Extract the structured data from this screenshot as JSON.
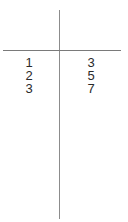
{
  "t_table": {
    "left_header": "",
    "right_header": "",
    "rows": [
      {
        "left": "1",
        "right": "3"
      },
      {
        "left": "2",
        "right": "5"
      },
      {
        "left": "3",
        "right": "7"
      }
    ]
  },
  "colors": {
    "line": "#8c8c8c",
    "text": "#2a2a2a",
    "background": "#ffffff"
  }
}
